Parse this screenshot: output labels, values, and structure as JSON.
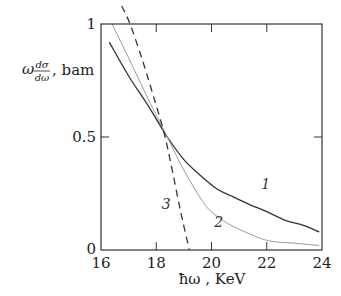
{
  "chart_data": {
    "type": "line",
    "title": "",
    "xlabel": "ħω , KeV",
    "ylabel": "ω dσ/dω , bam",
    "ylabel_parts": {
      "omega": "ω",
      "num": "dσ",
      "den": "dω",
      "unit": ", bam"
    },
    "xlim": [
      16,
      24
    ],
    "ylim": [
      0,
      1
    ],
    "x_ticks": [
      16,
      18,
      20,
      22,
      24
    ],
    "x_tick_labels": [
      "16",
      "18",
      "20",
      "22",
      "24"
    ],
    "y_ticks": [
      0,
      0.5,
      1
    ],
    "y_tick_labels": [
      "0",
      "0.5",
      "1"
    ],
    "grid": false,
    "legend": "inline curve labels",
    "series": [
      {
        "name": "1",
        "style": "solid",
        "color": "#333333",
        "label_pos": [
          21.8,
          0.27
        ],
        "points": [
          [
            16.3,
            0.92
          ],
          [
            17.0,
            0.77
          ],
          [
            17.7,
            0.64
          ],
          [
            18.4,
            0.5
          ],
          [
            19.0,
            0.4
          ],
          [
            19.6,
            0.33
          ],
          [
            20.2,
            0.27
          ],
          [
            20.7,
            0.24
          ],
          [
            21.4,
            0.2
          ],
          [
            22.0,
            0.17
          ],
          [
            22.7,
            0.13
          ],
          [
            23.3,
            0.11
          ],
          [
            23.9,
            0.08
          ]
        ]
      },
      {
        "name": "2",
        "style": "solid-light",
        "color": "#9a9a9a",
        "label_pos": [
          20.1,
          0.1
        ],
        "points": [
          [
            16.4,
            1.0
          ],
          [
            17.0,
            0.85
          ],
          [
            17.7,
            0.67
          ],
          [
            18.4,
            0.5
          ],
          [
            18.8,
            0.4
          ],
          [
            19.2,
            0.31
          ],
          [
            19.6,
            0.23
          ],
          [
            19.9,
            0.18
          ],
          [
            20.3,
            0.14
          ],
          [
            20.7,
            0.11
          ],
          [
            21.4,
            0.07
          ],
          [
            22.1,
            0.04
          ],
          [
            23.0,
            0.03
          ],
          [
            23.9,
            0.02
          ]
        ]
      },
      {
        "name": "3",
        "style": "dashed",
        "color": "#333333",
        "label_pos": [
          18.2,
          0.18
        ],
        "points": [
          [
            16.75,
            1.08
          ],
          [
            17.05,
            1.0
          ],
          [
            17.5,
            0.84
          ],
          [
            17.9,
            0.68
          ],
          [
            18.3,
            0.51
          ],
          [
            18.6,
            0.34
          ],
          [
            18.9,
            0.16
          ],
          [
            19.2,
            0.0
          ]
        ]
      }
    ]
  }
}
